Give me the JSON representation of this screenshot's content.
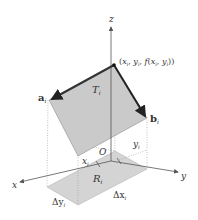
{
  "diagram": {
    "axes": {
      "x": "x",
      "y": "y",
      "z": "z",
      "origin": "O"
    },
    "point_label": {
      "open": "(",
      "x": "x",
      "xsub": "i",
      "sep1": ", ",
      "y": "y",
      "ysub": "i",
      "sep2": ", ",
      "f": "f",
      "fopen": "(",
      "fx": "x",
      "fxsub": "i",
      "fsep": ", ",
      "fy": "y",
      "fysub": "i",
      "close": "))"
    },
    "tangent_plane": {
      "name": "T",
      "sub": "i"
    },
    "vector_a": {
      "name": "a",
      "sub": "i"
    },
    "vector_b": {
      "name": "b",
      "sub": "i"
    },
    "region": {
      "name": "R",
      "sub": "i"
    },
    "x_tick": {
      "name": "x",
      "sub": "i"
    },
    "y_tick": {
      "name": "y",
      "sub": "i"
    },
    "delta_x": {
      "name": "Δx",
      "sub": "i"
    },
    "delta_y": {
      "name": "Δy",
      "sub": "i"
    },
    "colors": {
      "plane_fill": "#c8c8c8",
      "region_fill": "#d4d4d4",
      "axis": "#555555",
      "vector": "#333333"
    }
  }
}
